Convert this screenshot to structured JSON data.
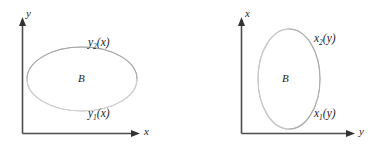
{
  "figure": {
    "background_color": "#ffffff",
    "axis_color": "#4d4d4d",
    "curve_color": "#b9b9b9",
    "text_color": "#1c1c1c"
  },
  "panels": [
    {
      "id": "vertically-simple",
      "vertical_axis_label": "y",
      "horizontal_axis_label": "x",
      "region_label": "B",
      "upper_curve": {
        "base": "y",
        "subscript": "2",
        "argument": "(x)",
        "full": "y₂(x)"
      },
      "lower_curve": {
        "base": "y",
        "subscript": "1",
        "argument": "(x)",
        "full": "y₁(x)"
      },
      "shape": {
        "kind": "ellipse",
        "center_x": 82,
        "center_y": 79,
        "radius_x": 55,
        "radius_y": 32
      }
    },
    {
      "id": "horizontally-simple",
      "vertical_axis_label": "x",
      "horizontal_axis_label": "y",
      "region_label": "B",
      "upper_curve": {
        "base": "x",
        "subscript": "2",
        "argument": "(y)",
        "full": "x₂(y)"
      },
      "lower_curve": {
        "base": "x",
        "subscript": "1",
        "argument": "(y)",
        "full": "x₁(y)"
      },
      "shape": {
        "kind": "ellipse",
        "center_x": 101,
        "center_y": 79,
        "radius_x": 31,
        "radius_y": 50
      }
    }
  ]
}
